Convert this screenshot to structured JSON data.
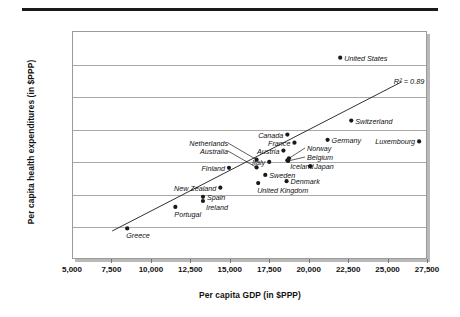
{
  "figure": {
    "ylabel": "Per capita health expenditures (in $PPP)",
    "xlabel": "Per capita GDP (in $PPP)",
    "r2_annotation": "R² = 0.89"
  },
  "chart_data": {
    "type": "scatter",
    "title": "",
    "xlabel": "Per capita GDP (in $PPP)",
    "ylabel": "Per capita health expenditures (in $PPP)",
    "xlim": [
      5000,
      27500
    ],
    "ylim": [
      0,
      3500
    ],
    "xticks": [
      5000,
      7500,
      10000,
      12500,
      15000,
      17500,
      20000,
      22500,
      25000,
      27500
    ],
    "xtick_labels": [
      "5,000",
      "7,500",
      "10,000",
      "12,500",
      "15,000",
      "17,500",
      "20,000",
      "22,500",
      "25,000",
      "27,500"
    ],
    "yticks": [
      0,
      500,
      1000,
      1500,
      2000,
      2500,
      3000,
      3500
    ],
    "ytick_labels": [
      "0",
      "500",
      "1,000",
      "1,500",
      "2,000",
      "2,500",
      "3,000",
      "3,500"
    ],
    "grid": true,
    "legend": "none",
    "annotations": [
      {
        "text": "R² = 0.89",
        "x": 25400,
        "y": 2720
      }
    ],
    "trendline": {
      "type": "linear-fit",
      "r_squared": 0.89,
      "x_start": 7550,
      "y_start": 430,
      "x_end": 25900,
      "y_end": 2720
    },
    "points": [
      {
        "name": "Greece",
        "x": 8500,
        "y": 470,
        "label_pos": "below"
      },
      {
        "name": "Portugal",
        "x": 11550,
        "y": 800,
        "label_pos": "below"
      },
      {
        "name": "Spain",
        "x": 13300,
        "y": 955,
        "label_pos": "right"
      },
      {
        "name": "Ireland",
        "x": 13300,
        "y": 890,
        "label_pos": "below-right"
      },
      {
        "name": "New Zealand",
        "x": 14400,
        "y": 1095,
        "label_pos": "left"
      },
      {
        "name": "Finland",
        "x": 14950,
        "y": 1400,
        "label_pos": "left"
      },
      {
        "name": "Australia",
        "x": 16700,
        "y": 1405,
        "label_pos": "leader-left"
      },
      {
        "name": "Netherlands",
        "x": 16700,
        "y": 1525,
        "label_pos": "leader-left"
      },
      {
        "name": "United Kingdom",
        "x": 16800,
        "y": 1165,
        "label_pos": "below"
      },
      {
        "name": "Sweden",
        "x": 17250,
        "y": 1290,
        "label_pos": "right"
      },
      {
        "name": "Italy",
        "x": 17500,
        "y": 1490,
        "label_pos": "left"
      },
      {
        "name": "Austria",
        "x": 18400,
        "y": 1665,
        "label_pos": "left"
      },
      {
        "name": "Canada",
        "x": 18650,
        "y": 1910,
        "label_pos": "left"
      },
      {
        "name": "Denmark",
        "x": 18600,
        "y": 1195,
        "label_pos": "right"
      },
      {
        "name": "Iceland",
        "x": 18650,
        "y": 1515,
        "label_pos": "below-right"
      },
      {
        "name": "Belgium",
        "x": 18700,
        "y": 1505,
        "label_pos": "leader-right"
      },
      {
        "name": "Norway",
        "x": 18750,
        "y": 1545,
        "label_pos": "leader-right"
      },
      {
        "name": "France",
        "x": 19100,
        "y": 1785,
        "label_pos": "left"
      },
      {
        "name": "Japan",
        "x": 20100,
        "y": 1425,
        "label_pos": "right"
      },
      {
        "name": "Germany",
        "x": 21200,
        "y": 1830,
        "label_pos": "right"
      },
      {
        "name": "United States",
        "x": 22000,
        "y": 3090,
        "label_pos": "right"
      },
      {
        "name": "Switzerland",
        "x": 22700,
        "y": 2125,
        "label_pos": "right"
      },
      {
        "name": "Luxembourg",
        "x": 27000,
        "y": 1805,
        "label_pos": "left"
      }
    ]
  }
}
